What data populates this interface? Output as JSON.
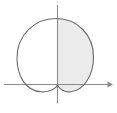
{
  "figure": {
    "title": "",
    "type": "polar-curve-plot",
    "background_color": "#ffffff",
    "width": 117,
    "height": 113,
    "axes": {
      "origin": {
        "x": 57.5,
        "y": 84.5
      },
      "color": "#8a8a8a",
      "stroke_width": 1.1,
      "x_axis": {
        "name": "x-axis",
        "x_start": 4,
        "x_end": 112,
        "y": 84.5,
        "has_arrow_right": true,
        "has_arrow_left": false,
        "label": ""
      },
      "y_axis": {
        "name": "y-axis",
        "y_start": 5,
        "y_end": 103,
        "x": 57.5,
        "has_arrow_top": false,
        "has_arrow_bottom": false,
        "label": ""
      },
      "arrow": {
        "name": "x-axis-arrowhead",
        "tip_x": 113,
        "tip_y": 84.5,
        "size": 6
      }
    },
    "curve": {
      "name": "cardioid-curve",
      "equation_type": "cardioid",
      "cusp": {
        "x": 57.5,
        "y": 85.0
      },
      "stroke_color": "#6b6b6b",
      "stroke_width": 1.1,
      "center": {
        "x": 55.0,
        "y": 51.0
      },
      "radius_x": 38.0,
      "radius_y": 34.0,
      "top_y": 18.5,
      "bottom_y": 92.0,
      "left_x": 17.0,
      "right_x": 93.5,
      "path": "M 57.5 85.0 C 57.5 85.0 54.0 92.5 41.0 91.8 C 26.0 91.0 17.0 76.0 17.0 58.0 C 17.0 35.0 34.5 18.5 56.0 18.5 C 77.5 18.5 93.5 35.0 93.5 57.0 C 93.5 75.5 83.5 91.0 70.5 91.8 C 60.5 92.4 57.5 85.0 57.5 85.0 Z"
    },
    "shaded_region": {
      "name": "shaded-right-half",
      "fill_color": "#ebebeb",
      "description": "region of the curve to the right of the vertical axis",
      "x_min": 57.5,
      "x_max": 93.5,
      "visible": true
    },
    "unshaded_region": {
      "name": "unshaded-left-half",
      "fill_color": "#ffffff",
      "x_min": 17.0,
      "x_max": 57.5,
      "visible": true
    }
  },
  "chart_data": {
    "type": "line",
    "title": "",
    "xlabel": "",
    "ylabel": "",
    "grid": false,
    "legend": null,
    "series": [
      {
        "name": "cardioid",
        "kind": "closed-curve",
        "cusp_at_origin": true,
        "cusp_direction": "down",
        "max_extent_up": 66,
        "max_extent_left": -40.5,
        "max_extent_right": 36,
        "max_extent_down": -7.5
      }
    ],
    "annotations": [
      {
        "name": "shaded-area",
        "kind": "region-fill",
        "color": "#ebebeb",
        "bounds": "x >= 0 within curve"
      }
    ],
    "axis_ranges": {
      "x": [
        -53.5,
        55.5
      ],
      "y": [
        -28.5,
        79.5
      ]
    },
    "tick_labels": {
      "x": [],
      "y": []
    }
  }
}
